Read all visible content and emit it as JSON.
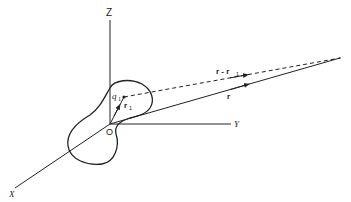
{
  "diagram": {
    "type": "3d-coordinate-vector-diagram",
    "colors": {
      "line": "#222222",
      "background": "#ffffff"
    },
    "axes": {
      "z": {
        "label": "Z"
      },
      "y": {
        "label": "Y"
      },
      "x": {
        "label": "X"
      }
    },
    "origin": {
      "label": "O"
    },
    "charge": {
      "label": "q",
      "subscript": "1"
    },
    "vectors": {
      "r1": {
        "label": "r",
        "subscript": "1",
        "style": "solid"
      },
      "r": {
        "label": "r",
        "style": "solid"
      },
      "r_minus_r1": {
        "label": "r - r",
        "subscript": "1",
        "style": "dashed"
      }
    },
    "body": {
      "shape": "closed-irregular-blob"
    }
  }
}
